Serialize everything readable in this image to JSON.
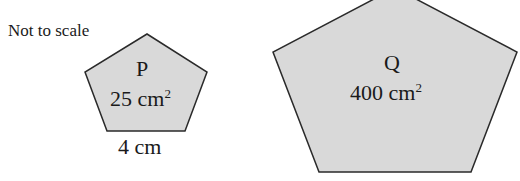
{
  "diagram": {
    "note": "Not to scale",
    "shapes": [
      {
        "name": "P",
        "area_value": "25 cm",
        "area_exp": "2",
        "side_label": "4 cm"
      },
      {
        "name": "Q",
        "area_value": "400 cm",
        "area_exp": "2"
      }
    ],
    "colors": {
      "fill": "#d9d9d9",
      "stroke": "#2a2a2a"
    }
  }
}
